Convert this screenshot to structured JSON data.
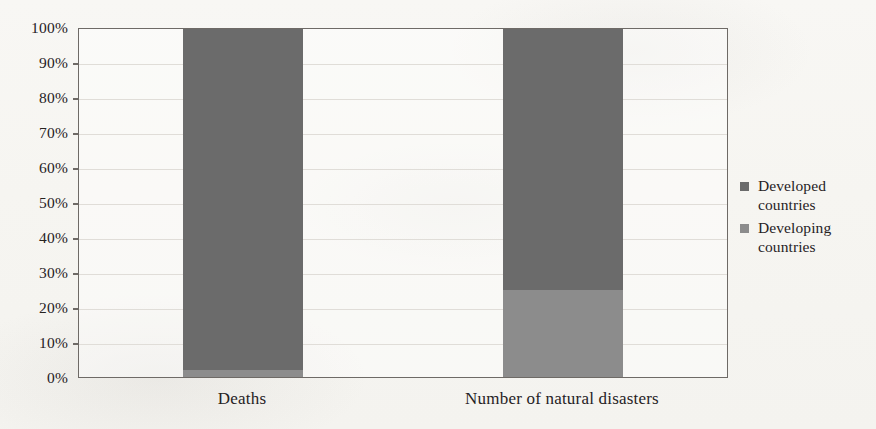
{
  "chart_data": {
    "type": "bar",
    "subtype": "100% stacked column",
    "title": "",
    "xlabel": "",
    "ylabel": "",
    "categories": [
      "Deaths",
      "Number of natural disasters"
    ],
    "series": [
      {
        "name": "Developed countries",
        "color": "#6b6b6b",
        "values": [
          98,
          75
        ]
      },
      {
        "name": "Developing countries",
        "color": "#8c8c8c",
        "values": [
          2,
          25
        ]
      }
    ],
    "ylim": [
      0,
      100
    ],
    "y_tick_labels": [
      "100%",
      "90%",
      "80%",
      "70%",
      "60%",
      "50%",
      "40%",
      "30%",
      "20%",
      "10%",
      "0%"
    ],
    "y_tick_values": [
      100,
      90,
      80,
      70,
      60,
      50,
      40,
      30,
      20,
      10,
      0
    ],
    "grid": true,
    "legend_position": "right",
    "legend": [
      {
        "label_line1": "Developed",
        "label_line2": "countries",
        "color": "#6b6b6b"
      },
      {
        "label_line1": "Developing",
        "label_line2": "countries",
        "color": "#8c8c8c"
      }
    ]
  },
  "axis": {
    "y_labels": [
      "100%",
      "90%",
      "80%",
      "70%",
      "60%",
      "50%",
      "40%",
      "30%",
      "20%",
      "10%",
      "0%"
    ],
    "x_labels": [
      "Deaths",
      "Number of natural disasters"
    ]
  },
  "colors": {
    "developed": "#6b6b6b",
    "developing": "#8c8c8c",
    "axis_line": "#6e6a66",
    "gridline": "#e0ddd8",
    "background": "#f7f6f3",
    "text": "#26221f"
  }
}
